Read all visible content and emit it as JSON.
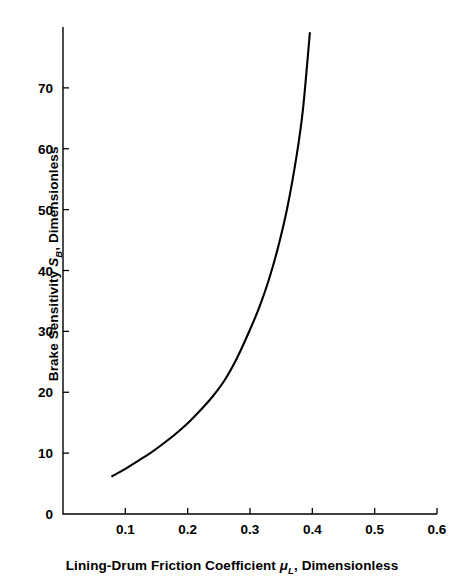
{
  "chart_data": {
    "type": "line",
    "title": "",
    "xlabel_parts": {
      "pre": "Lining-Drum Friction Coefficient ",
      "symbol": "μ",
      "subscript": "L",
      "post": ", Dimensionless"
    },
    "ylabel_parts": {
      "pre": "Brake Sensitivity ",
      "symbol": "S",
      "subscript": "B",
      "post": ", Dimensionless"
    },
    "xlabel": "Lining-Drum Friction Coefficient μL, Dimensionless",
    "ylabel": "Brake Sensitivity SB, Dimensionless",
    "xlim": [
      0,
      0.6
    ],
    "ylim": [
      0,
      80
    ],
    "xticks": [
      0.1,
      0.2,
      0.3,
      0.4,
      0.5,
      0.6
    ],
    "xtick_labels": [
      "0.1",
      "0.2",
      "0.3",
      "0.4",
      "0.5",
      "0.6"
    ],
    "yticks": [
      0,
      10,
      20,
      30,
      40,
      50,
      60,
      70
    ],
    "ytick_labels": [
      "0",
      "10",
      "20",
      "30",
      "40",
      "50",
      "60",
      "70"
    ],
    "grid": false,
    "legend": null,
    "series": [
      {
        "name": "Brake sensitivity vs lining-drum friction coefficient",
        "color": "#000000",
        "x": [
          0.079,
          0.1,
          0.12,
          0.14,
          0.16,
          0.18,
          0.2,
          0.22,
          0.24,
          0.26,
          0.28,
          0.3,
          0.315,
          0.33,
          0.345,
          0.36,
          0.375,
          0.385,
          0.396
        ],
        "y": [
          6.2,
          7.4,
          8.7,
          10.0,
          11.5,
          13.1,
          14.9,
          17.0,
          19.3,
          22.1,
          25.8,
          30.3,
          34.0,
          38.4,
          43.8,
          50.4,
          59.0,
          66.5,
          79.0
        ]
      }
    ]
  },
  "axes_geometry": {
    "x_left_px": 63,
    "x_right_px": 437,
    "y_bottom_px": 514,
    "y_top_px": 27
  }
}
